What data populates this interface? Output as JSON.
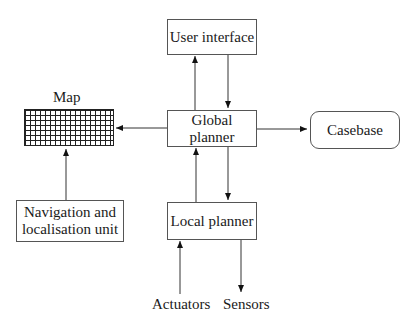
{
  "diagram": {
    "nodes": {
      "user_interface": "User interface",
      "global_planner": "Global planner",
      "local_planner": "Local planner",
      "casebase": "Casebase",
      "map": "Map",
      "navigation_unit_line1": "Navigation and",
      "navigation_unit_line2": "localisation unit",
      "actuators": "Actuators",
      "sensors": "Sensors"
    },
    "edges": [
      {
        "from": "Global planner",
        "to": "User interface"
      },
      {
        "from": "User interface",
        "to": "Global planner"
      },
      {
        "from": "Global planner",
        "to": "Map"
      },
      {
        "from": "Global planner",
        "to": "Casebase"
      },
      {
        "from": "Navigation and localisation unit",
        "to": "Map"
      },
      {
        "from": "Local planner",
        "to": "Global planner"
      },
      {
        "from": "Global planner",
        "to": "Local planner"
      },
      {
        "from": "Actuators",
        "to": "Local planner"
      },
      {
        "from": "Local planner",
        "to": "Sensors"
      }
    ]
  }
}
